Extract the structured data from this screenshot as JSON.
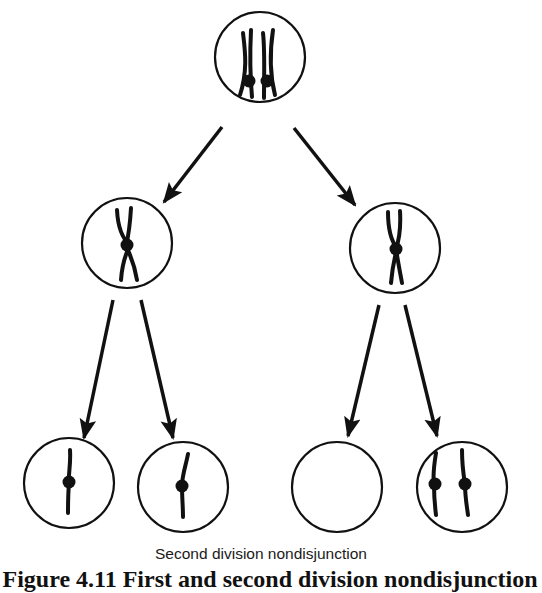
{
  "figure": {
    "label": "Second division nondisjunction",
    "caption_partial": "Figure 4.11   First and second division nondisjunction",
    "stroke_color": "#111111",
    "background": "#ffffff"
  },
  "cells": [
    {
      "id": "parent",
      "description": "cell with two replicated chromosomes (sister chromatids paired)"
    },
    {
      "id": "daughter-left",
      "description": "cell with one replicated chromosome"
    },
    {
      "id": "daughter-right",
      "description": "cell with one replicated chromosome"
    },
    {
      "id": "gamete-1",
      "description": "one chromosome"
    },
    {
      "id": "gamete-2",
      "description": "one chromosome"
    },
    {
      "id": "gamete-3",
      "description": "no chromosomes"
    },
    {
      "id": "gamete-4",
      "description": "two chromosomes"
    }
  ]
}
